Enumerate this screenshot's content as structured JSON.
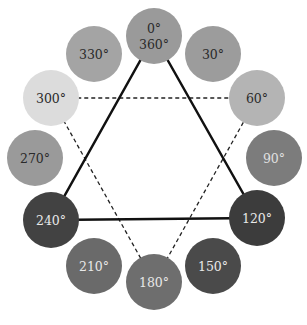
{
  "diagram": {
    "type": "color-wheel-hue-triangles",
    "circle_radius": 28,
    "circles": [
      {
        "label": "0°",
        "label2": "360°",
        "cx": 154,
        "cy": 36,
        "fill": "#9a9a9a",
        "text": "#2a2a2a"
      },
      {
        "label": "30°",
        "cx": 213,
        "cy": 54,
        "fill": "#9c9c9c",
        "text": "#2a2a2a"
      },
      {
        "label": "60°",
        "cx": 257,
        "cy": 98,
        "fill": "#b4b4b4",
        "text": "#2a2a2a"
      },
      {
        "label": "90°",
        "cx": 274,
        "cy": 158,
        "fill": "#7c7c7c",
        "text": "#e0e0e0"
      },
      {
        "label": "120°",
        "cx": 257,
        "cy": 218,
        "fill": "#3c3c3c",
        "text": "#e8e8e8"
      },
      {
        "label": "150°",
        "cx": 213,
        "cy": 266,
        "fill": "#4a4a4a",
        "text": "#e8e8e8"
      },
      {
        "label": "180°",
        "cx": 154,
        "cy": 282,
        "fill": "#6e6e6e",
        "text": "#e8e8e8"
      },
      {
        "label": "210°",
        "cx": 94,
        "cy": 266,
        "fill": "#6a6a6a",
        "text": "#e8e8e8"
      },
      {
        "label": "240°",
        "cx": 51,
        "cy": 220,
        "fill": "#424242",
        "text": "#e8e8e8"
      },
      {
        "label": "270°",
        "cx": 35,
        "cy": 158,
        "fill": "#9a9a9a",
        "text": "#2a2a2a"
      },
      {
        "label": "300°",
        "cx": 51,
        "cy": 98,
        "fill": "#dcdcdc",
        "text": "#2a2a2a"
      },
      {
        "label": "330°",
        "cx": 94,
        "cy": 54,
        "fill": "#a4a4a4",
        "text": "#2a2a2a"
      }
    ],
    "solid_triangle": {
      "vertices": [
        "0°",
        "120°",
        "240°"
      ],
      "color": "#111111",
      "width": 2.5
    },
    "dashed_triangle": {
      "vertices": [
        "60°",
        "180°",
        "300°"
      ],
      "color": "#222222",
      "width": 1.3
    }
  }
}
